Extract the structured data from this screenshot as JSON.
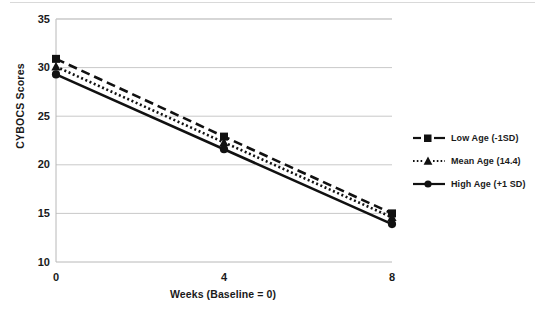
{
  "figure": {
    "background_color": "#ffffff",
    "ink_color": "#111111",
    "gridline_color": "#c9c9c9"
  },
  "axes": {
    "y_title": "CYBOCS Scores",
    "x_title": "Weeks (Baseline = 0)",
    "y_ticks": [
      "35",
      "30",
      "25",
      "20",
      "15",
      "10"
    ],
    "x_ticks": [
      "0",
      "4",
      "8"
    ]
  },
  "legend": {
    "position": "right",
    "entries": [
      {
        "label": "Low Age (-1SD)",
        "marker": "square-marker",
        "line_style": "dashed"
      },
      {
        "label": "Mean Age (14.4)",
        "marker": "triangle-marker",
        "line_style": "dotted"
      },
      {
        "label": "High Age (+1 SD)",
        "marker": "circle-marker",
        "line_style": "solid"
      }
    ]
  },
  "chart_data": {
    "type": "line",
    "title": "",
    "subtitle": "",
    "xlabel": "Weeks (Baseline = 0)",
    "ylabel": "CYBOCS Scores",
    "x": [
      0,
      4,
      8
    ],
    "xlim": [
      0,
      8
    ],
    "ylim": [
      10,
      35
    ],
    "xticks": [
      0,
      4,
      8
    ],
    "yticks": [
      10,
      15,
      20,
      25,
      30,
      35
    ],
    "grid": "horizontal",
    "legend_position": "right",
    "series": [
      {
        "name": "Low Age (-1SD)",
        "values": [
          30.9,
          22.9,
          15.0
        ],
        "line_style": "dashed",
        "marker": "square",
        "color": "#111111"
      },
      {
        "name": "Mean Age (14.4)",
        "values": [
          30.1,
          22.3,
          14.6
        ],
        "line_style": "dotted",
        "marker": "triangle",
        "color": "#111111"
      },
      {
        "name": "High Age (+1 SD)",
        "values": [
          29.3,
          21.6,
          13.9
        ],
        "line_style": "solid",
        "marker": "circle",
        "color": "#111111"
      }
    ]
  }
}
